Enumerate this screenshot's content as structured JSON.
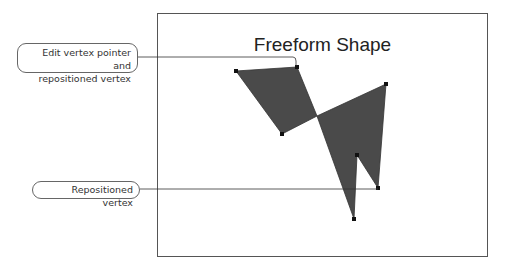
{
  "title": "Freeform Shape",
  "callouts": [
    {
      "line1": "Edit vertex pointer and",
      "line2": "repositioned vertex"
    },
    {
      "line1": "Repositioned vertex"
    }
  ],
  "colors": {
    "shape_fill": "#4a4a4a",
    "frame": "#555555",
    "leader": "#333333"
  }
}
